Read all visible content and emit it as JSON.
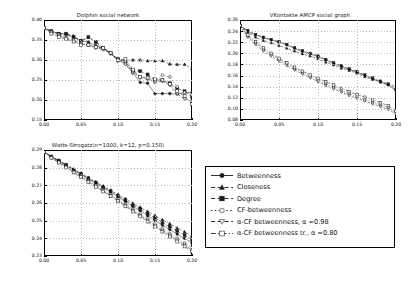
{
  "figure": {
    "background": "#ffffff",
    "line_color": "#1a1a1a",
    "grid_color": "#bdbdbd"
  },
  "legend": {
    "name": "series-legend",
    "position": "bottom-right",
    "entries": [
      {
        "label": "Betweenness",
        "marker": "filled-circle",
        "linestyle": "solid"
      },
      {
        "label": "Closeness",
        "marker": "filled-triangle-up",
        "linestyle": "dashed"
      },
      {
        "label": "Degree",
        "marker": "filled-square",
        "linestyle": "dashed"
      },
      {
        "label": "CF-betweenness",
        "marker": "open-circle",
        "linestyle": "dotted"
      },
      {
        "label": "α-CF betweenness, α =0.98",
        "marker": "open-triangle-down",
        "linestyle": "dashed"
      },
      {
        "label": "α-CF betweenness tr., α =0.80",
        "marker": "open-square",
        "linestyle": "dash-dot"
      }
    ]
  },
  "chart_data": [
    {
      "type": "line",
      "panel": "dolphin",
      "title": "Dolphin social network",
      "xlabel": "",
      "ylabel": "",
      "xlim": [
        0.0,
        0.2
      ],
      "ylim": [
        0.15,
        0.4
      ],
      "xticks": [
        "0.00",
        "0.05",
        "0.10",
        "0.15",
        "0.20"
      ],
      "xtickvals": [
        0.0,
        0.05,
        0.1,
        0.15,
        0.2
      ],
      "yticks": [
        "0.15",
        "0.20",
        "0.25",
        "0.30",
        "0.35",
        "0.40"
      ],
      "ytickvals": [
        0.15,
        0.2,
        0.25,
        0.3,
        0.35,
        0.4
      ],
      "grid": true,
      "x": [
        0.0,
        0.01,
        0.02,
        0.03,
        0.04,
        0.05,
        0.06,
        0.07,
        0.08,
        0.09,
        0.1,
        0.11,
        0.12,
        0.13,
        0.14,
        0.15,
        0.16,
        0.17,
        0.18,
        0.19,
        0.2
      ],
      "series": [
        {
          "name": "Betweenness",
          "values": [
            0.38,
            0.372,
            0.366,
            0.364,
            0.356,
            0.348,
            0.345,
            0.336,
            0.33,
            0.316,
            0.302,
            0.29,
            0.268,
            0.244,
            0.242,
            0.216,
            0.216,
            0.216,
            0.215,
            0.219,
            0.219
          ]
        },
        {
          "name": "Closeness",
          "values": [
            0.38,
            0.372,
            0.366,
            0.366,
            0.36,
            0.348,
            0.357,
            0.345,
            0.33,
            0.318,
            0.3,
            0.3,
            0.3,
            0.3,
            0.298,
            0.298,
            0.298,
            0.29,
            0.289,
            0.289,
            0.278
          ]
        },
        {
          "name": "Degree",
          "values": [
            0.38,
            0.372,
            0.366,
            0.366,
            0.358,
            0.348,
            0.357,
            0.345,
            0.33,
            0.318,
            0.302,
            0.297,
            0.272,
            0.272,
            0.264,
            0.25,
            0.249,
            0.242,
            0.229,
            0.222,
            0.208
          ]
        },
        {
          "name": "CF-betweenness",
          "values": [
            0.38,
            0.368,
            0.362,
            0.352,
            0.348,
            0.34,
            0.337,
            0.33,
            0.326,
            0.316,
            0.297,
            0.29,
            0.268,
            0.256,
            0.252,
            0.244,
            0.262,
            0.258,
            0.233,
            0.219,
            0.213
          ]
        },
        {
          "name": "α-CF betweenness, α=0.98",
          "values": [
            0.38,
            0.37,
            0.364,
            0.356,
            0.35,
            0.34,
            0.338,
            0.332,
            0.328,
            0.316,
            0.299,
            0.296,
            0.27,
            0.258,
            0.254,
            0.246,
            0.247,
            0.237,
            0.215,
            0.203,
            0.196
          ]
        },
        {
          "name": "α-CF betweenness tr., α=0.80",
          "values": [
            0.38,
            0.366,
            0.358,
            0.352,
            0.346,
            0.338,
            0.338,
            0.332,
            0.33,
            0.318,
            0.3,
            0.302,
            0.276,
            0.258,
            0.256,
            0.252,
            0.25,
            0.24,
            0.222,
            0.21,
            0.19
          ]
        }
      ]
    },
    {
      "type": "line",
      "panel": "vkontakte",
      "title": "VKontakte AMCP social graph",
      "xlabel": "",
      "ylabel": "",
      "xlim": [
        0.0,
        0.2
      ],
      "ylim": [
        0.08,
        0.26
      ],
      "xticks": [
        "0.00",
        "0.05",
        "0.10",
        "0.15",
        "0.20"
      ],
      "xtickvals": [
        0.0,
        0.05,
        0.1,
        0.15,
        0.2
      ],
      "yticks": [
        "0.08",
        "0.10",
        "0.12",
        "0.14",
        "0.16",
        "0.18",
        "0.20",
        "0.22",
        "0.24",
        "0.26"
      ],
      "ytickvals": [
        0.08,
        0.1,
        0.12,
        0.14,
        0.16,
        0.18,
        0.2,
        0.22,
        0.24,
        0.26
      ],
      "grid": true,
      "x": [
        0.0,
        0.01,
        0.02,
        0.03,
        0.04,
        0.05,
        0.06,
        0.07,
        0.08,
        0.09,
        0.1,
        0.11,
        0.12,
        0.13,
        0.14,
        0.15,
        0.16,
        0.17,
        0.18,
        0.19,
        0.2
      ],
      "series": [
        {
          "name": "Betweenness",
          "values": [
            0.25,
            0.24,
            0.233,
            0.228,
            0.224,
            0.22,
            0.215,
            0.209,
            0.203,
            0.199,
            0.194,
            0.188,
            0.182,
            0.176,
            0.171,
            0.166,
            0.16,
            0.154,
            0.149,
            0.143,
            0.133
          ]
        },
        {
          "name": "Closeness",
          "values": [
            0.25,
            0.238,
            0.229,
            0.223,
            0.219,
            0.214,
            0.209,
            0.204,
            0.199,
            0.195,
            0.19,
            0.184,
            0.179,
            0.173,
            0.169,
            0.164,
            0.158,
            0.153,
            0.148,
            0.144,
            0.141
          ]
        },
        {
          "name": "Degree",
          "values": [
            0.25,
            0.241,
            0.234,
            0.229,
            0.225,
            0.221,
            0.216,
            0.21,
            0.205,
            0.2,
            0.195,
            0.189,
            0.183,
            0.178,
            0.172,
            0.167,
            0.161,
            0.156,
            0.15,
            0.145,
            0.135
          ]
        },
        {
          "name": "CF-betweenness",
          "values": [
            0.25,
            0.231,
            0.219,
            0.207,
            0.198,
            0.189,
            0.181,
            0.173,
            0.166,
            0.159,
            0.152,
            0.145,
            0.139,
            0.133,
            0.127,
            0.122,
            0.117,
            0.112,
            0.107,
            0.102,
            0.094
          ]
        },
        {
          "name": "α-CF betweenness, α=0.98",
          "values": [
            0.25,
            0.229,
            0.216,
            0.204,
            0.195,
            0.186,
            0.178,
            0.17,
            0.163,
            0.156,
            0.149,
            0.142,
            0.136,
            0.13,
            0.124,
            0.119,
            0.114,
            0.109,
            0.104,
            0.099,
            0.091
          ]
        },
        {
          "name": "α-CF betweenness tr., α=0.80",
          "values": [
            0.25,
            0.233,
            0.221,
            0.21,
            0.2,
            0.191,
            0.183,
            0.175,
            0.168,
            0.161,
            0.155,
            0.149,
            0.143,
            0.137,
            0.131,
            0.126,
            0.121,
            0.116,
            0.111,
            0.106,
            0.096
          ]
        }
      ]
    },
    {
      "type": "line",
      "panel": "watts-strogatz",
      "title": "Watts-Strogatz(n=1000, k=12, p=0.150)",
      "xlabel": "",
      "ylabel": "",
      "xlim": [
        0.0,
        0.2
      ],
      "ylim": [
        0.23,
        0.29
      ],
      "xticks": [
        "0.00",
        "0.05",
        "0.10",
        "0.15",
        "0.20"
      ],
      "xtickvals": [
        0.0,
        0.05,
        0.1,
        0.15,
        0.2
      ],
      "yticks": [
        "0.23",
        "0.24",
        "0.25",
        "0.26",
        "0.27",
        "0.28",
        "0.29"
      ],
      "ytickvals": [
        0.23,
        0.24,
        0.25,
        0.26,
        0.27,
        0.28,
        0.29
      ],
      "grid": true,
      "x": [
        0.0,
        0.01,
        0.02,
        0.03,
        0.04,
        0.05,
        0.06,
        0.07,
        0.08,
        0.09,
        0.1,
        0.11,
        0.12,
        0.13,
        0.14,
        0.15,
        0.16,
        0.17,
        0.18,
        0.19,
        0.2
      ],
      "series": [
        {
          "name": "Betweenness",
          "values": [
            0.289,
            0.2862,
            0.2838,
            0.2812,
            0.2786,
            0.2762,
            0.2736,
            0.2712,
            0.2686,
            0.2662,
            0.2634,
            0.2608,
            0.258,
            0.2556,
            0.2528,
            0.2502,
            0.2474,
            0.245,
            0.2424,
            0.24,
            0.2374
          ]
        },
        {
          "name": "Closeness",
          "values": [
            0.289,
            0.2864,
            0.2842,
            0.2818,
            0.2792,
            0.2768,
            0.2744,
            0.272,
            0.2696,
            0.2672,
            0.2648,
            0.2624,
            0.2598,
            0.2576,
            0.2552,
            0.2528,
            0.2504,
            0.2482,
            0.2458,
            0.2436,
            0.2414
          ]
        },
        {
          "name": "Degree",
          "values": [
            0.289,
            0.2863,
            0.284,
            0.2815,
            0.2789,
            0.2765,
            0.274,
            0.2716,
            0.2691,
            0.2667,
            0.2641,
            0.2616,
            0.2589,
            0.2566,
            0.254,
            0.2515,
            0.2489,
            0.2466,
            0.2441,
            0.2418,
            0.2394
          ]
        },
        {
          "name": "CF-betweenness",
          "values": [
            0.289,
            0.2858,
            0.2832,
            0.2806,
            0.2778,
            0.2752,
            0.2726,
            0.27,
            0.2674,
            0.2648,
            0.262,
            0.2592,
            0.2564,
            0.2538,
            0.251,
            0.2482,
            0.2454,
            0.2428,
            0.24,
            0.2374,
            0.2348
          ]
        },
        {
          "name": "α-CF betweenness, α=0.98",
          "values": [
            0.289,
            0.2857,
            0.283,
            0.2803,
            0.2775,
            0.2748,
            0.2722,
            0.2695,
            0.2669,
            0.2642,
            0.2614,
            0.2586,
            0.2557,
            0.253,
            0.2502,
            0.2473,
            0.2445,
            0.2418,
            0.239,
            0.2362,
            0.2334
          ]
        },
        {
          "name": "α-CF betweenness tr., α=0.80",
          "values": [
            0.289,
            0.2856,
            0.2829,
            0.2801,
            0.2773,
            0.2746,
            0.2719,
            0.2692,
            0.2665,
            0.2638,
            0.261,
            0.2581,
            0.2552,
            0.2524,
            0.2495,
            0.2466,
            0.2438,
            0.241,
            0.2382,
            0.2354,
            0.2326
          ]
        }
      ]
    }
  ]
}
